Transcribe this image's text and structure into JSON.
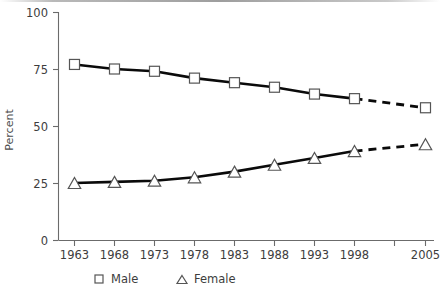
{
  "chart_data": {
    "type": "line",
    "title": "",
    "subtitle": "",
    "xlabel": "",
    "ylabel": "Percent",
    "categories": [
      "1963",
      "1968",
      "1973",
      "1978",
      "1983",
      "1988",
      "1993",
      "1998",
      "2005"
    ],
    "x_tick_labels": [
      "1963",
      "1968",
      "1973",
      "1978",
      "1983",
      "1988",
      "1993",
      "1998",
      "",
      "2005"
    ],
    "y_tick_labels": [
      "0",
      "25",
      "50",
      "75",
      "100"
    ],
    "y_ticks": [
      0,
      25,
      50,
      75,
      100
    ],
    "ylim": [
      0,
      100
    ],
    "grid": false,
    "legend_position": "bottom",
    "series": [
      {
        "name": "Male",
        "marker": "square",
        "values": [
          77,
          75,
          74,
          71,
          69,
          67,
          64,
          62,
          58
        ],
        "projected_from": "1998",
        "projected_values": [
          62,
          58
        ]
      },
      {
        "name": "Female",
        "marker": "triangle",
        "values": [
          25,
          25.5,
          26,
          27.5,
          30,
          33,
          36,
          39,
          42
        ],
        "projected_from": "1998",
        "projected_values": [
          39,
          42
        ]
      }
    ],
    "annotations": []
  },
  "legend": {
    "items": [
      {
        "label": "Male",
        "marker_name": "square-marker-icon"
      },
      {
        "label": "Female",
        "marker_name": "triangle-marker-icon"
      }
    ]
  },
  "axis": {
    "y_title": "Percent"
  },
  "colors": {
    "line": "#0a0a0a",
    "axis": "#6b6b6b",
    "marker_fill": "#ffffff",
    "marker_stroke": "#555555",
    "text": "#3d3d3d",
    "background": "#ffffff"
  }
}
